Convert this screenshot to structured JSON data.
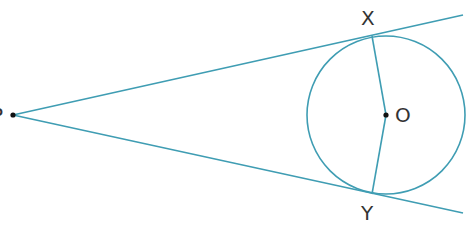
{
  "diagram": {
    "colors": {
      "line": "#3f9db3",
      "text": "#333333",
      "point": "#111111"
    },
    "points": {
      "P": {
        "label": "P",
        "x": 13,
        "y": 115
      },
      "O": {
        "label": "O",
        "x": 386,
        "y": 115
      },
      "X": {
        "label": "X",
        "x": 372,
        "y": 36
      },
      "Y": {
        "label": "Y",
        "x": 372,
        "y": 194
      }
    },
    "circle": {
      "center": "O",
      "radius": 79
    },
    "segments": [
      "PX (tangent, extended)",
      "PY (tangent, extended)",
      "OX (radius)",
      "OY (radius)"
    ]
  }
}
